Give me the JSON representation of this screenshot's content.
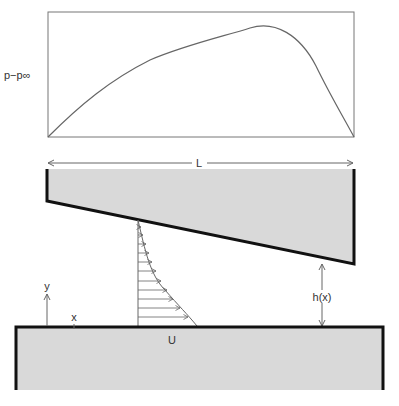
{
  "diagram": {
    "type": "slider-bearing-lubrication",
    "pressure_plot": {
      "ylabel": "p−p∞",
      "curve_points": [
        [
          48,
          137
        ],
        [
          75,
          110
        ],
        [
          100,
          88
        ],
        [
          125,
          72
        ],
        [
          150,
          60
        ],
        [
          175,
          51
        ],
        [
          200,
          44
        ],
        [
          225,
          36
        ],
        [
          245,
          29
        ],
        [
          262,
          26
        ],
        [
          278,
          28
        ],
        [
          293,
          36
        ],
        [
          305,
          48
        ],
        [
          316,
          66
        ],
        [
          330,
          95
        ],
        [
          354,
          137
        ]
      ]
    },
    "labels": {
      "length": "L",
      "gap": "h(x)",
      "y_axis": "y",
      "x_axis": "x",
      "velocity": "U"
    },
    "velocity_profile": {
      "arrow_rows": [
        {
          "y": 227,
          "x_end": 141
        },
        {
          "y": 235,
          "x_end": 143
        },
        {
          "y": 244,
          "x_end": 146
        },
        {
          "y": 253,
          "x_end": 149
        },
        {
          "y": 262,
          "x_end": 152
        },
        {
          "y": 271,
          "x_end": 156
        },
        {
          "y": 281,
          "x_end": 161
        },
        {
          "y": 290,
          "x_end": 167
        },
        {
          "y": 299,
          "x_end": 173
        },
        {
          "y": 308,
          "x_end": 180
        },
        {
          "y": 317,
          "x_end": 188
        }
      ]
    },
    "colors": {
      "solid_fill": "#d9d9d9",
      "solid_edge": "#111111",
      "line": "#666666",
      "text": "#333333"
    }
  }
}
